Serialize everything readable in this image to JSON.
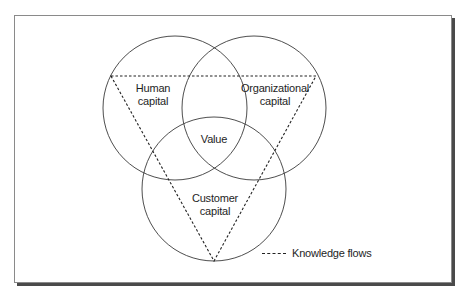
{
  "diagram": {
    "circles": [
      {
        "id": "human",
        "label_lines": [
          "Human",
          "capital"
        ]
      },
      {
        "id": "organizational",
        "label_lines": [
          "Organizational",
          "capital"
        ]
      },
      {
        "id": "customer",
        "label_lines": [
          "Customer",
          "capital"
        ]
      }
    ],
    "center_label": "Value",
    "legend": {
      "line_style": "dashed",
      "label": "Knowledge flows"
    },
    "colors": {
      "stroke": "#3a3a3a",
      "dash": "#222222",
      "frame_border": "#8a8a8a",
      "frame_shadow": "#4a4a4a",
      "background": "#ffffff"
    }
  }
}
